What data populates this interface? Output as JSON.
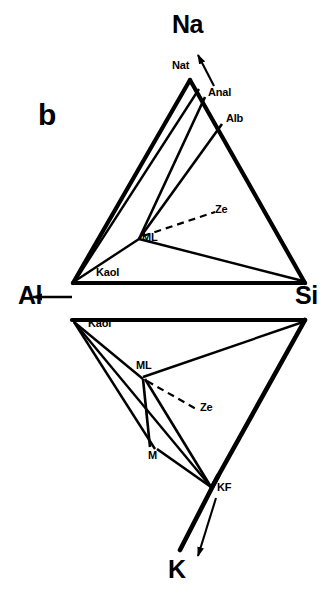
{
  "figure": {
    "panel_label": "b",
    "type": "phase-diagram",
    "axis_labels": {
      "na": "Na",
      "al": "Al",
      "si": "Si",
      "k": "K"
    },
    "upper_triangle": {
      "name": "Na-Al-Si system",
      "nodes": [
        {
          "id": "nat",
          "label": "Nat",
          "x": 190,
          "y": 78
        },
        {
          "id": "anal",
          "label": "Anal",
          "x": 205,
          "y": 95
        },
        {
          "id": "alb",
          "label": "Alb",
          "x": 222,
          "y": 122
        },
        {
          "id": "ml",
          "label": "ML",
          "x": 139,
          "y": 237
        },
        {
          "id": "kaol",
          "label": "Kaol",
          "x": 73,
          "y": 283
        },
        {
          "id": "si",
          "label": "",
          "x": 305,
          "y": 283
        },
        {
          "id": "ze",
          "label": "Ze",
          "x": 218,
          "y": 216
        }
      ]
    },
    "lower_triangle": {
      "name": "K-Al-Si system",
      "nodes": [
        {
          "id": "kaol",
          "label": "Kaol",
          "x": 72,
          "y": 320
        },
        {
          "id": "si",
          "label": "",
          "x": 305,
          "y": 320
        },
        {
          "id": "ml",
          "label": "ML",
          "x": 143,
          "y": 377
        },
        {
          "id": "m",
          "label": "M",
          "x": 155,
          "y": 447
        },
        {
          "id": "kf",
          "label": "KF",
          "x": 212,
          "y": 485
        },
        {
          "id": "ze",
          "label": "Ze",
          "x": 200,
          "y": 412
        }
      ]
    },
    "legend_notes": {
      "nat": "Natrolite",
      "anal": "Analcime",
      "alb": "Albite",
      "ml": "Mixed Layer",
      "kaol": "Kaolinite",
      "ze": "Zeolite",
      "m": "Mica",
      "kf": "K-Feldspar"
    },
    "colors": {
      "line": "#000000",
      "background": "#ffffff"
    }
  }
}
